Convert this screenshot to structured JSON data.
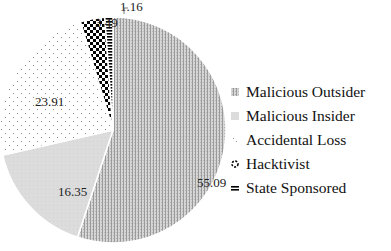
{
  "chart_data": {
    "type": "pie",
    "title": "",
    "categories": [
      "Malicious Outsider",
      "Malicious Insider",
      "Accidental Loss",
      "Hacktivist",
      "State Sponsored"
    ],
    "values": [
      55.09,
      16.35,
      23.91,
      3.49,
      1.16
    ],
    "labels": [
      "55.09",
      "16.35",
      "23.91",
      "3.49",
      "1.16"
    ],
    "start_angle_deg": 0,
    "direction": "clockwise",
    "legend_position": "right",
    "fill_patterns": [
      "fine-vertical-lines-gray",
      "solid-light-gray",
      "sparse-dots",
      "checkerboard-black",
      "horizontal-stripes-black"
    ]
  },
  "legend": {
    "items": [
      {
        "label": "Malicious Outsider"
      },
      {
        "label": "Malicious Insider"
      },
      {
        "label": "Accidental Loss"
      },
      {
        "label": "Hacktivist"
      },
      {
        "label": "State Sponsored"
      }
    ]
  }
}
